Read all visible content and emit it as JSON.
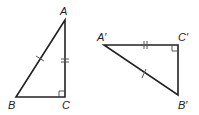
{
  "diagram": {
    "type": "congruent-right-triangles",
    "triangles": [
      {
        "name": "ABC",
        "vertices": {
          "A": {
            "label": "A",
            "x": 65,
            "y": 20
          },
          "B": {
            "label": "B",
            "x": 16,
            "y": 97
          },
          "C": {
            "label": "C",
            "x": 65,
            "y": 97
          }
        },
        "right_angle_at": "C",
        "marks": {
          "hypotenuse_AB": "single-tick",
          "leg_AC": "double-tick"
        }
      },
      {
        "name": "A'B'C'",
        "vertices": {
          "A": {
            "label": "A′",
            "x": 104,
            "y": 45
          },
          "C": {
            "label": "C′",
            "x": 178,
            "y": 45
          },
          "B": {
            "label": "B′",
            "x": 178,
            "y": 95
          }
        },
        "right_angle_at": "C′",
        "marks": {
          "hypotenuse_A'B'": "single-tick",
          "leg_A'C'": "double-tick"
        }
      }
    ],
    "colors": {
      "line": "#222222",
      "background": "#ffffff"
    }
  }
}
